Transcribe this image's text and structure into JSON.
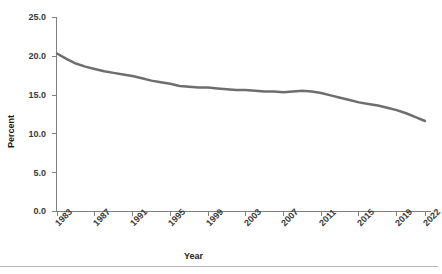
{
  "chart_data": {
    "type": "line",
    "title": "",
    "subtitle": "",
    "xlabel": "Year",
    "ylabel": "Percent",
    "xlim": [
      1983,
      2022
    ],
    "ylim": [
      0.0,
      25.0
    ],
    "grid": false,
    "legend": false,
    "legend_position": "none",
    "line_color": "#6e6e6e",
    "line_width": 2.5,
    "axis_color": "#808080",
    "y_ticks": [
      "0.0",
      "5.0",
      "10.0",
      "15.0",
      "20.0",
      "25.0"
    ],
    "y_tick_values": [
      0.0,
      5.0,
      10.0,
      15.0,
      20.0,
      25.0
    ],
    "x_ticks": [
      "1983",
      "1987",
      "1991",
      "1995",
      "1999",
      "2003",
      "2007",
      "2011",
      "2015",
      "2019",
      "2022"
    ],
    "x_tick_values": [
      1983,
      1987,
      1991,
      1995,
      1999,
      2003,
      2007,
      2011,
      2015,
      2019,
      2022
    ],
    "series": [
      {
        "name": "Percent",
        "x": [
          1983,
          1984,
          1985,
          1986,
          1987,
          1988,
          1989,
          1990,
          1991,
          1992,
          1993,
          1994,
          1995,
          1996,
          1997,
          1998,
          1999,
          2000,
          2001,
          2002,
          2003,
          2004,
          2005,
          2006,
          2007,
          2008,
          2009,
          2010,
          2011,
          2012,
          2013,
          2014,
          2015,
          2016,
          2017,
          2018,
          2019,
          2020,
          2021,
          2022
        ],
        "values": [
          20.3,
          19.6,
          19.0,
          18.6,
          18.3,
          18.0,
          17.8,
          17.6,
          17.4,
          17.1,
          16.8,
          16.6,
          16.4,
          16.1,
          16.0,
          15.9,
          15.9,
          15.8,
          15.7,
          15.6,
          15.6,
          15.5,
          15.4,
          15.4,
          15.3,
          15.4,
          15.5,
          15.4,
          15.2,
          14.9,
          14.6,
          14.3,
          14.0,
          13.8,
          13.6,
          13.3,
          13.0,
          12.6,
          12.1,
          11.6
        ]
      }
    ]
  },
  "footer": {
    "rule": "horizontal-divider"
  }
}
